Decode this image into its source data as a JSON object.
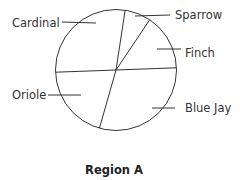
{
  "chart_data": {
    "type": "pie",
    "title": "Region A",
    "start_angle_deg": 8.7,
    "direction": "clockwise",
    "slices": [
      {
        "label": "Sparrow",
        "percent": 7
      },
      {
        "label": "Finch",
        "percent": 15
      },
      {
        "label": "Blue Jay",
        "percent": 30
      },
      {
        "label": "Oriole",
        "percent": 20
      },
      {
        "label": "Cardinal",
        "percent": 28
      }
    ],
    "fill": "#ffffff",
    "stroke": "#333333",
    "legend": "callout labels with leader lines"
  },
  "labels": {
    "sparrow": "Sparrow",
    "finch": "Finch",
    "blue_jay": "Blue Jay",
    "oriole": "Oriole",
    "cardinal": "Cardinal",
    "title": "Region A"
  }
}
